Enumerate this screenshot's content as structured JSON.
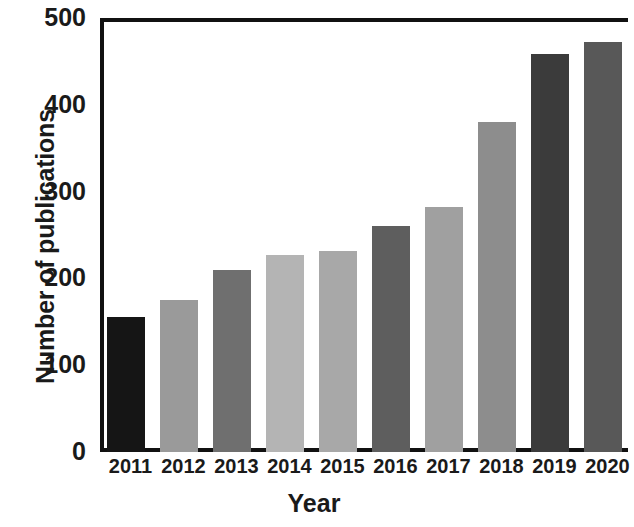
{
  "chart_data": {
    "type": "bar",
    "title": "",
    "xlabel": "Year",
    "ylabel": "Number of publications",
    "categories": [
      "2011",
      "2012",
      "2013",
      "2014",
      "2015",
      "2016",
      "2017",
      "2018",
      "2019",
      "2020"
    ],
    "values": [
      155,
      175,
      210,
      227,
      232,
      260,
      282,
      380,
      458,
      472
    ],
    "bar_colors": [
      "#151515",
      "#9a9a9a",
      "#6f6f6f",
      "#b4b4b4",
      "#a8a8a8",
      "#5e5e5e",
      "#a0a0a0",
      "#8d8d8d",
      "#3b3b3b",
      "#585858"
    ],
    "ylim": [
      0,
      500
    ],
    "ytick_labels": [
      "0",
      "100",
      "200",
      "300",
      "400",
      "500"
    ],
    "ytick_values": [
      0,
      100,
      200,
      300,
      400,
      500
    ],
    "xlim_note": "2020 bar clipped at right image edge",
    "grid": false,
    "legend": "none",
    "axis_color": "#111111"
  }
}
